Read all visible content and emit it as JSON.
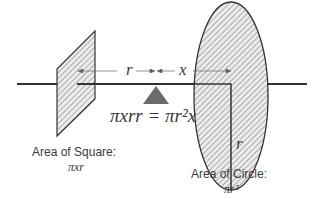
{
  "diagram": {
    "labels": {
      "r_top": "r",
      "x_top": "x",
      "r_circle": "r",
      "equation": "πxrr = πr²x",
      "square_title": "Area of Square:",
      "square_formula": "πxr",
      "circle_title": "Area of Circle:",
      "circle_formula": "πr²"
    },
    "colors": {
      "stroke": "#333333",
      "hatch": "#9a9a9a",
      "fulcrum": "#6b6b6b",
      "text": "#3a3a3a"
    }
  }
}
